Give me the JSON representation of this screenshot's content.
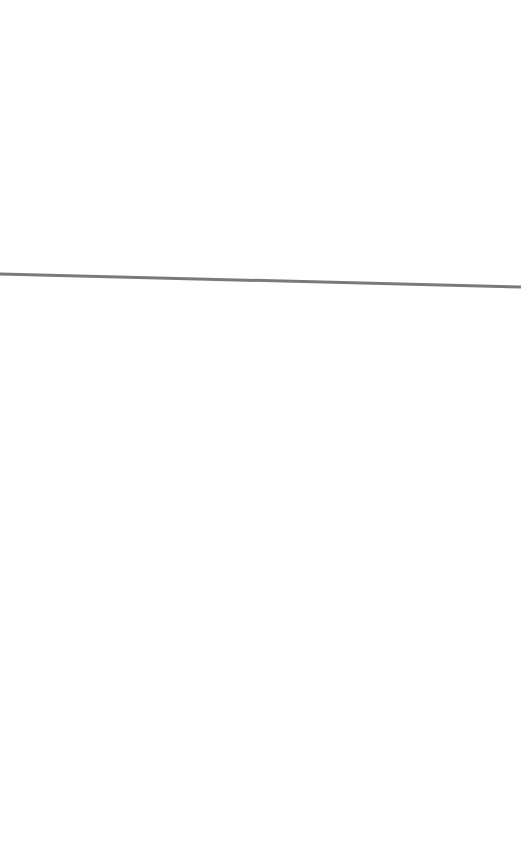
{
  "page": {
    "background": "#ffffff"
  },
  "divider": {
    "color": "#7a7a7a",
    "x1": 0,
    "y1": 274,
    "x2": 521,
    "y2": 287,
    "thickness": 3
  }
}
